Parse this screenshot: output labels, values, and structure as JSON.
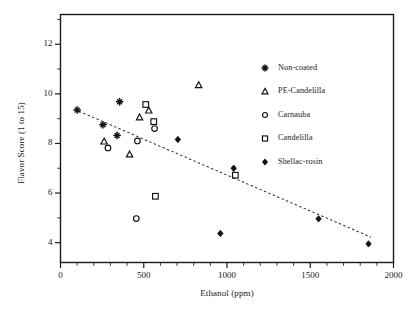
{
  "chart_data": {
    "type": "scatter",
    "title": "",
    "xlabel": "Ethanol (ppm)",
    "ylabel": "Flavor Score (1 to 15)",
    "xlim": [
      0,
      2000
    ],
    "ylim": [
      3.2,
      13.2
    ],
    "xticks": [
      0,
      500,
      1000,
      1500,
      2000
    ],
    "yticks": [
      4,
      6,
      8,
      10,
      12
    ],
    "xtick_labels": [
      "0",
      "500",
      "1000",
      "1500",
      "2000"
    ],
    "ytick_labels": [
      "4",
      "6",
      "8",
      "10",
      "12"
    ],
    "x_minor_tick_interval": 100,
    "y_minor_tick_interval": 1,
    "grid": false,
    "legend_position": "top-right-inside",
    "frame": "box",
    "series": [
      {
        "name": "Non-coated",
        "marker": "plus",
        "filled": true,
        "points": [
          {
            "x": 100,
            "y": 9.35
          },
          {
            "x": 255,
            "y": 8.75
          },
          {
            "x": 340,
            "y": 8.32
          },
          {
            "x": 355,
            "y": 9.68
          }
        ]
      },
      {
        "name": "PE-Candelilla",
        "marker": "triangle",
        "filled": false,
        "points": [
          {
            "x": 262,
            "y": 8.08
          },
          {
            "x": 415,
            "y": 7.56
          },
          {
            "x": 475,
            "y": 9.05
          },
          {
            "x": 530,
            "y": 9.33
          },
          {
            "x": 830,
            "y": 10.35
          }
        ]
      },
      {
        "name": "Carnauba",
        "marker": "circle",
        "filled": false,
        "points": [
          {
            "x": 285,
            "y": 7.82
          },
          {
            "x": 455,
            "y": 4.97
          },
          {
            "x": 462,
            "y": 8.1
          },
          {
            "x": 565,
            "y": 8.6
          }
        ]
      },
      {
        "name": "Candelilla",
        "marker": "square",
        "filled": false,
        "points": [
          {
            "x": 512,
            "y": 9.57
          },
          {
            "x": 560,
            "y": 8.88
          },
          {
            "x": 570,
            "y": 5.87
          },
          {
            "x": 1050,
            "y": 6.72
          }
        ]
      },
      {
        "name": "Shellac-rosin",
        "marker": "diamond",
        "filled": true,
        "points": [
          {
            "x": 705,
            "y": 8.16
          },
          {
            "x": 960,
            "y": 4.37
          },
          {
            "x": 1040,
            "y": 7.0
          },
          {
            "x": 1550,
            "y": 4.96
          },
          {
            "x": 1850,
            "y": 3.95
          }
        ]
      }
    ],
    "trendline": {
      "style": "dashed",
      "x_start": 110,
      "y_start": 9.3,
      "x_end": 1865,
      "y_end": 4.22
    }
  },
  "legend": {
    "items": [
      {
        "label": "Non-coated",
        "marker": "plus"
      },
      {
        "label": "PE-Candelilla",
        "marker": "triangle"
      },
      {
        "label": "Carnauba",
        "marker": "circle"
      },
      {
        "label": "Candelilla",
        "marker": "square"
      },
      {
        "label": "Shellac-rosin",
        "marker": "diamond"
      }
    ]
  },
  "colors": {
    "axis": "#1a1a1a",
    "marker": "#111111",
    "trendline": "#333333",
    "background": "#ffffff"
  }
}
